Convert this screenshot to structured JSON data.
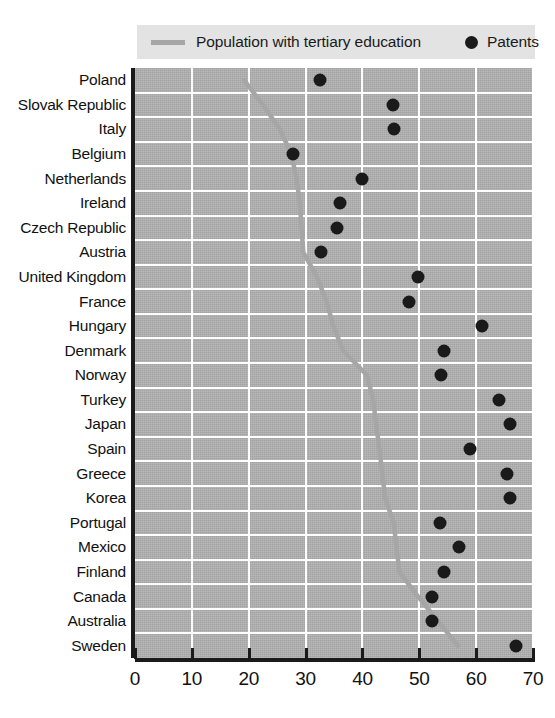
{
  "legend": {
    "line_label": "Population with tertiary education",
    "dot_label": "Patents",
    "line_color": "#a6a6a6",
    "dot_color": "#1a1a1a",
    "background": "#e3e3e3"
  },
  "axis": {
    "x_ticks": [
      "0",
      "10",
      "20",
      "30",
      "40",
      "50",
      "60",
      "70"
    ],
    "x_min": 0,
    "x_max": 70,
    "x_step": 10
  },
  "style": {
    "plot_background": "#b0b0b0",
    "gridline_color": "#ffffff",
    "axis_color": "#1a1a1a"
  },
  "chart_data": {
    "type": "scatter",
    "title": "",
    "xlabel": "",
    "ylabel": "",
    "xlim": [
      0,
      70
    ],
    "grid": true,
    "legend_position": "top",
    "categories": [
      "Poland",
      "Slovak Republic",
      "Italy",
      "Belgium",
      "Netherlands",
      "Ireland",
      "Czech Republic",
      "Austria",
      "United Kingdom",
      "France",
      "Hungary",
      "Denmark",
      "Norway",
      "Turkey",
      "Japan",
      "Spain",
      "Greece",
      "Korea",
      "Portugal",
      "Mexico",
      "Finland",
      "Canada",
      "Australia",
      "Sweden"
    ],
    "series": [
      {
        "name": "Patents",
        "marker": "dot",
        "values": [
          32.5,
          45.4,
          45.5,
          27.8,
          40.0,
          36.1,
          35.5,
          32.7,
          49.8,
          48.2,
          61.0,
          54.3,
          53.9,
          64.0,
          66.0,
          58.9,
          65.4,
          66.0,
          53.6,
          56.9,
          54.4,
          52.2,
          52.2,
          67.0
        ]
      },
      {
        "name": "Population with tertiary education",
        "marker": "line",
        "values": [
          19.2,
          22.5,
          25.5,
          27.5,
          28.4,
          29.0,
          29.3,
          29.6,
          32.0,
          33.7,
          34.9,
          36.6,
          40.8,
          41.9,
          42.4,
          43.0,
          43.5,
          44.0,
          45.5,
          46.0,
          46.5,
          49.8,
          53.3,
          56.8
        ]
      }
    ]
  }
}
